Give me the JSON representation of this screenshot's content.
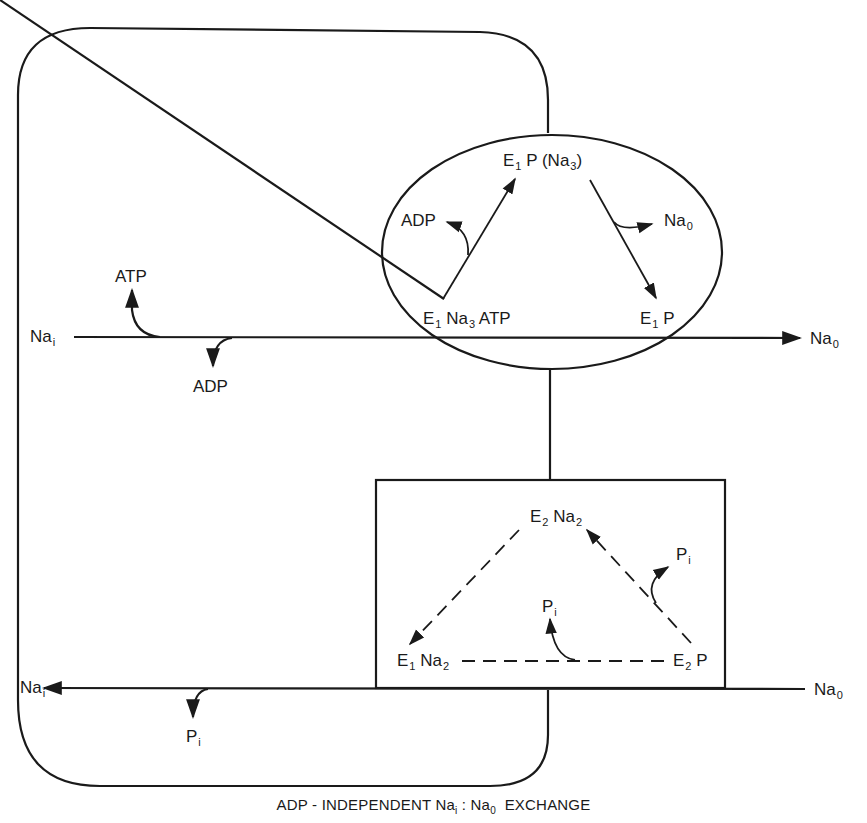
{
  "diagram": {
    "caption": {
      "prefix": "ADP - INDEPENDENT Na",
      "sub1": "i",
      "mid": " : Na",
      "sub2": "0",
      "suffix": "  EXCHANGE"
    },
    "upper_flux": {
      "left": {
        "base": "Na",
        "sub": "i"
      },
      "right": {
        "base": "Na",
        "sub": "0"
      },
      "input": "ATP",
      "output": "ADP"
    },
    "lower_flux": {
      "left": {
        "base": "Na",
        "sub": "i"
      },
      "right": {
        "base": "Na",
        "sub": "0"
      },
      "output": {
        "base": "P",
        "sub": "i"
      }
    },
    "phosphorylation_cycle": {
      "shape": "ellipse",
      "states": {
        "top": {
          "e": "E",
          "esub": "1",
          "rest": " P (Na",
          "rsub": "3",
          "close": ")"
        },
        "bottom_left": {
          "e": "E",
          "esub": "1",
          "rest": " Na",
          "rsub": "3",
          "tail": " ATP"
        },
        "bottom_right": {
          "e": "E",
          "esub": "1",
          "rest": " P"
        }
      },
      "side_products": {
        "left": "ADP",
        "right": {
          "base": "Na",
          "sub": "0"
        }
      }
    },
    "dephosphorylation_cycle": {
      "shape": "rectangle",
      "line_style": "dashed",
      "states": {
        "top": {
          "e": "E",
          "esub": "2",
          "rest": " Na",
          "rsub": "2"
        },
        "bottom_left": {
          "e": "E",
          "esub": "1",
          "rest": " Na",
          "rsub": "2"
        },
        "bottom_right": {
          "e": "E",
          "esub": "2",
          "rest": " P"
        }
      },
      "side_products": {
        "right": {
          "base": "P",
          "sub": "i"
        },
        "bottom": {
          "base": "P",
          "sub": "i"
        }
      }
    },
    "colors": {
      "ink": "#1a1a1a",
      "background": "#ffffff"
    }
  }
}
